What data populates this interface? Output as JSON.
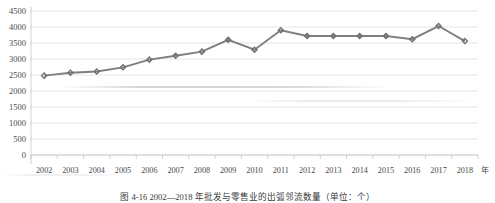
{
  "figure": {
    "caption": "图 4-16  2002—2018 年批发与零售业的出弧邻流数量（单位：个）",
    "unit_suffix": "年"
  },
  "chart_data": {
    "type": "line",
    "title": "",
    "xlabel": "",
    "ylabel": "",
    "grid": true,
    "legend": false,
    "ylim": [
      0,
      4500
    ],
    "ytick_step": 500,
    "yticks": [
      "0",
      "500",
      "1000",
      "1500",
      "2000",
      "2500",
      "3000",
      "3500",
      "4000",
      "4500"
    ],
    "categories": [
      "2002",
      "2003",
      "2004",
      "2005",
      "2006",
      "2007",
      "2008",
      "2009",
      "2010",
      "2011",
      "2012",
      "2013",
      "2014",
      "2015",
      "2016",
      "2017",
      "2018"
    ],
    "series": [
      {
        "name": "出弧邻流数量",
        "color": "#7f7f7f",
        "marker": "diamond",
        "values": [
          2480,
          2570,
          2610,
          2740,
          2980,
          3100,
          3230,
          3600,
          3290,
          3900,
          3720,
          3720,
          3720,
          3720,
          3620,
          4030,
          3560
        ]
      }
    ]
  }
}
